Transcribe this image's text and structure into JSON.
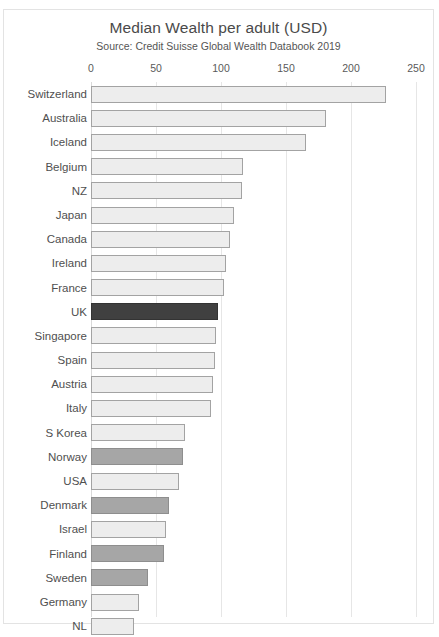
{
  "chart_data": {
    "type": "bar",
    "orientation": "horizontal",
    "title": "Median Wealth per adult (USD)",
    "subtitle": "Source: Credit Suisse Global Wealth Databook 2019",
    "xlabel": "",
    "ylabel": "",
    "xlim": [
      0,
      250
    ],
    "xticks": [
      0,
      50,
      100,
      150,
      200,
      250
    ],
    "xtick_labels": [
      "0",
      "50",
      "100",
      "150",
      "200",
      "250"
    ],
    "grid": "vertical",
    "legend": "none",
    "categories": [
      "Switzerland",
      "Australia",
      "Iceland",
      "Belgium",
      "NZ",
      "Japan",
      "Canada",
      "Ireland",
      "France",
      "UK",
      "Singapore",
      "Spain",
      "Austria",
      "Italy",
      "S Korea",
      "Norway",
      "USA",
      "Denmark",
      "Israel",
      "Finland",
      "Sweden",
      "Germany",
      "NL"
    ],
    "values": [
      227,
      181,
      165,
      117,
      116,
      110,
      107,
      104,
      102,
      98,
      96,
      95,
      94,
      92,
      72,
      71,
      68,
      60,
      58,
      56,
      44,
      37,
      33
    ],
    "bar_styles": [
      "light",
      "light",
      "light",
      "light",
      "light",
      "light",
      "light",
      "light",
      "light",
      "dark",
      "light",
      "light",
      "light",
      "light",
      "light",
      "medium",
      "light",
      "medium",
      "light",
      "medium",
      "medium",
      "light",
      "light"
    ],
    "colors": {
      "light_bar": "#ededed",
      "medium_bar": "#a6a6a6",
      "highlight_bar": "#404040",
      "bar_border": "#9b9b9b",
      "gridline": "#e6e6e6",
      "frame_border": "#e3e3e3",
      "title_text": "#4a4a4a",
      "label_text": "#4f4f4f"
    }
  }
}
